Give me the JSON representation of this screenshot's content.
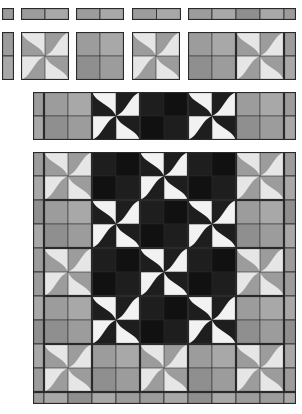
{
  "colors": {
    "gray_light": "#e6e6e6",
    "gray_mid": "#9c9c9c",
    "gray_mid2": "#a8a8a8",
    "gray_dark": "#8f8f8f",
    "black_a": "#1e1e1e",
    "black_b": "#111111",
    "white": "#f2f2f2",
    "seam": "#2a2a2a"
  },
  "block_size": 48,
  "components": {
    "corner_square": {
      "x": 2,
      "y": 8,
      "w": 12,
      "h": 12
    },
    "sashing_h": [
      {
        "x": 21,
        "y": 8,
        "w": 48,
        "h": 12,
        "cells": 2
      },
      {
        "x": 76,
        "y": 8,
        "w": 48,
        "h": 12,
        "cells": 2
      },
      {
        "x": 132,
        "y": 8,
        "w": 49,
        "h": 12,
        "cells": 2
      },
      {
        "x": 188,
        "y": 8,
        "w": 108,
        "h": 12,
        "cells": [
          24,
          24,
          24,
          24,
          12
        ]
      }
    ],
    "sashing_v": {
      "x": 2,
      "y": 32,
      "w": 12,
      "h": 48,
      "cells": 2
    },
    "blocks_row": [
      {
        "x": 21,
        "y": 32,
        "type": "gray-pinwheel"
      },
      {
        "x": 76,
        "y": 32,
        "type": "gray-fourpatch"
      },
      {
        "x": 132,
        "y": 32,
        "type": "gray-pinwheel"
      },
      {
        "x": 188,
        "y": 32,
        "type": "gray-fourpatch"
      },
      {
        "x": 236,
        "y": 32,
        "type": "gray-pinwheel"
      },
      {
        "x": 284,
        "y": 32,
        "type": "strip-v",
        "w": 12
      }
    ]
  },
  "middle_strip": {
    "x": 33,
    "y": 92,
    "height": 48,
    "items": [
      {
        "type": "strip-v",
        "w": 11
      },
      {
        "type": "gray-fourpatch"
      },
      {
        "type": "bw-pinwheel"
      },
      {
        "type": "black-fourpatch"
      },
      {
        "type": "bw-pinwheel"
      },
      {
        "type": "gray-fourpatch"
      },
      {
        "type": "strip-v",
        "w": 12
      }
    ]
  },
  "quilt": {
    "x": 33,
    "y": 152,
    "left_strip_w": 11,
    "right_strip_w": 12,
    "bottom_strip_h": 12,
    "rows": [
      [
        "gray-pinwheel",
        "black-fourpatch",
        "bw-pinwheel",
        "black-fourpatch",
        "gray-pinwheel"
      ],
      [
        "gray-fourpatch",
        "bw-pinwheel",
        "black-fourpatch",
        "bw-pinwheel",
        "gray-fourpatch"
      ],
      [
        "gray-pinwheel",
        "black-fourpatch",
        "bw-pinwheel",
        "black-fourpatch",
        "gray-pinwheel"
      ],
      [
        "gray-fourpatch",
        "bw-pinwheel",
        "black-fourpatch",
        "bw-pinwheel",
        "gray-fourpatch"
      ],
      [
        "gray-pinwheel",
        "gray-fourpatch",
        "gray-pinwheel",
        "gray-fourpatch",
        "gray-pinwheel"
      ]
    ]
  }
}
